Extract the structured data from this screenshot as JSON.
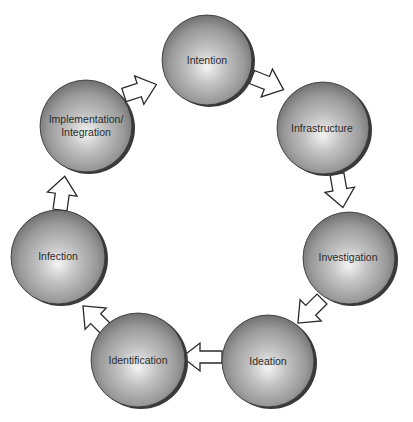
{
  "diagram": {
    "type": "cycle",
    "direction": "clockwise",
    "nodes": [
      {
        "id": "intention",
        "label": "Intention",
        "cx": 207,
        "cy": 60,
        "r": 45
      },
      {
        "id": "infrastructure",
        "label": "Infrastructure",
        "cx": 323,
        "cy": 128,
        "r": 46
      },
      {
        "id": "investigation",
        "label": "Investigation",
        "cx": 349,
        "cy": 258,
        "r": 46
      },
      {
        "id": "ideation",
        "label": "Ideation",
        "cx": 268,
        "cy": 361,
        "r": 46
      },
      {
        "id": "identification",
        "label": "Identification",
        "cx": 138,
        "cy": 360,
        "r": 47
      },
      {
        "id": "infection",
        "label": "Infection",
        "cx": 58,
        "cy": 257,
        "r": 47
      },
      {
        "id": "implementation",
        "label_line1": "Implementation/",
        "label_line2": "Integration",
        "cx": 86,
        "cy": 126,
        "r": 46
      }
    ],
    "edges": [
      {
        "from": "intention",
        "to": "infrastructure"
      },
      {
        "from": "infrastructure",
        "to": "investigation"
      },
      {
        "from": "investigation",
        "to": "ideation"
      },
      {
        "from": "ideation",
        "to": "identification"
      },
      {
        "from": "identification",
        "to": "infection"
      },
      {
        "from": "infection",
        "to": "implementation"
      },
      {
        "from": "implementation",
        "to": "intention"
      }
    ],
    "colors": {
      "sphere_highlight": "#f2f2f2",
      "sphere_mid": "#a9a9a9",
      "sphere_edge": "#6e6e6e",
      "sphere_shadow": "#3a3a3a",
      "arrow_fill": "#ffffff",
      "arrow_stroke": "#2a2a2a",
      "text": "#2b2b2b",
      "background": "#ffffff"
    }
  }
}
